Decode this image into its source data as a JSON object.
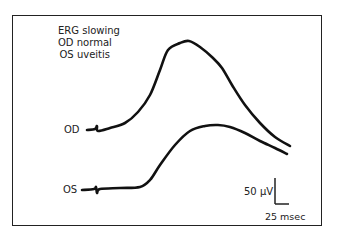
{
  "chart_data": {
    "type": "line",
    "title": [
      "ERG slowing",
      "OD normal",
      "OS uveitis"
    ],
    "xlabel": "",
    "ylabel": "",
    "grid": false,
    "legend": "none",
    "series": [
      {
        "name": "OD",
        "description": "normal ERG waveform",
        "points_px": [
          [
            87,
            130
          ],
          [
            95,
            129
          ],
          [
            97,
            126
          ],
          [
            98,
            131
          ],
          [
            110,
            128
          ],
          [
            125,
            123
          ],
          [
            138,
            112
          ],
          [
            150,
            95
          ],
          [
            160,
            70
          ],
          [
            168,
            50
          ],
          [
            180,
            43
          ],
          [
            189,
            41
          ],
          [
            200,
            47
          ],
          [
            213,
            58
          ],
          [
            222,
            68
          ],
          [
            232,
            85
          ],
          [
            245,
            105
          ],
          [
            260,
            123
          ],
          [
            275,
            137
          ],
          [
            290,
            146
          ]
        ]
      },
      {
        "name": "OS",
        "description": "uveitis ERG waveform (slowed)",
        "points_px": [
          [
            82,
            190
          ],
          [
            94,
            189
          ],
          [
            96,
            187
          ],
          [
            97,
            193
          ],
          [
            100,
            189
          ],
          [
            120,
            188
          ],
          [
            140,
            187
          ],
          [
            150,
            180
          ],
          [
            160,
            165
          ],
          [
            175,
            145
          ],
          [
            190,
            131
          ],
          [
            205,
            126
          ],
          [
            218,
            125
          ],
          [
            230,
            127
          ],
          [
            245,
            133
          ],
          [
            260,
            141
          ],
          [
            275,
            148
          ],
          [
            287,
            154
          ]
        ]
      }
    ],
    "scale_bar": {
      "vertical": "50 μV",
      "horizontal": "25 msec"
    },
    "labels": {
      "od": "OD",
      "os": "OS"
    }
  },
  "annotation": {
    "line1": "ERG slowing",
    "line2": "OD normal",
    "line3": "OS uveitis"
  },
  "trace_labels": {
    "od": "OD",
    "os": "OS"
  },
  "scale": {
    "amplitude": "50 μV",
    "time": "25 msec"
  },
  "colors": {
    "trace": "#111111",
    "frame": "#222222",
    "background": "#ffffff"
  }
}
